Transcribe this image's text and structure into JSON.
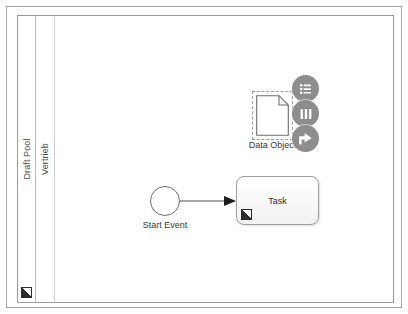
{
  "editor": {
    "name": "bpmn-modeler-canvas"
  },
  "pool": {
    "label": "Draft Pool",
    "marker_icon": "edit-marker-icon"
  },
  "lane": {
    "label": "Vertrieb"
  },
  "elements": {
    "start_event": {
      "label": "Start Event",
      "shape": "circle"
    },
    "task": {
      "label": "Task",
      "shape": "rounded-rectangle",
      "marker_icon": "edit-marker-icon"
    },
    "data_object": {
      "label": "Data Object",
      "shape": "document-folded-corner",
      "selected": "true"
    },
    "sequence_flow": {
      "from": "Start Event",
      "to": "Task"
    }
  },
  "context_pad": {
    "buttons": [
      {
        "name": "list-menu-icon",
        "title": "Change type"
      },
      {
        "name": "columns-icon",
        "title": "Lanes"
      },
      {
        "name": "share-arrow-icon",
        "title": "Connect"
      }
    ]
  },
  "colors": {
    "frame_border": "#a8a8a8",
    "pool_border": "#9a9a9a",
    "shape_stroke": "#6e6e6e",
    "pad_background": "#8d8d8d",
    "text": "#3a3a3a"
  }
}
